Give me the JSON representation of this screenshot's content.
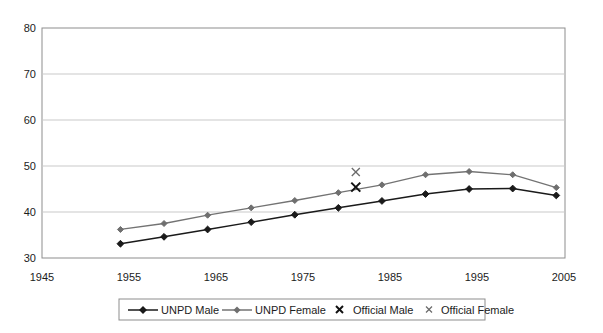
{
  "chart_data": {
    "type": "line",
    "title": "",
    "xlabel": "",
    "ylabel": "",
    "xlim": [
      1945,
      2005
    ],
    "ylim": [
      30,
      80
    ],
    "xticks": [
      1945,
      1955,
      1965,
      1975,
      1985,
      1995,
      2005
    ],
    "yticks": [
      30,
      40,
      50,
      60,
      70,
      80
    ],
    "grid": true,
    "legend_position": "bottom",
    "x": [
      1954,
      1959,
      1964,
      1969,
      1974,
      1979,
      1984,
      1989,
      1994,
      1999,
      2004
    ],
    "series": [
      {
        "name": "UNPD Male",
        "type": "line",
        "marker": "diamond",
        "color": "#1a1a1a",
        "values": [
          33.1,
          34.6,
          36.2,
          37.8,
          39.4,
          40.9,
          42.4,
          43.9,
          45.0,
          45.1,
          43.6
        ]
      },
      {
        "name": "UNPD Female",
        "type": "line",
        "marker": "diamond",
        "color": "#737373",
        "values": [
          36.2,
          37.5,
          39.3,
          40.9,
          42.5,
          44.2,
          45.9,
          48.1,
          48.8,
          48.1,
          45.3
        ]
      },
      {
        "name": "Official Male",
        "type": "scatter",
        "marker": "x-bold",
        "color": "#111111",
        "points": [
          {
            "x": 1981,
            "y": 45.4
          }
        ]
      },
      {
        "name": "Official Female",
        "type": "scatter",
        "marker": "x-thin",
        "color": "#6b6b6b",
        "points": [
          {
            "x": 1981,
            "y": 48.7
          }
        ]
      }
    ]
  },
  "axis": {
    "y_tick_labels": [
      "80",
      "70",
      "60",
      "50",
      "40",
      "30"
    ],
    "x_tick_labels": [
      "1945",
      "1955",
      "1965",
      "1975",
      "1985",
      "1995",
      "2005"
    ]
  },
  "legend": {
    "items": [
      {
        "label": "UNPD Male",
        "marker": "line-diamond-dark"
      },
      {
        "label": "UNPD Female",
        "marker": "line-diamond-gray"
      },
      {
        "label": "Official Male",
        "marker": "x-bold"
      },
      {
        "label": "Official Female",
        "marker": "x-thin"
      }
    ]
  },
  "colors": {
    "background": "#ffffff",
    "axis": "#8d8d8d",
    "grid": "#c9c9c9",
    "male": "#1a1a1a",
    "female": "#737373"
  }
}
